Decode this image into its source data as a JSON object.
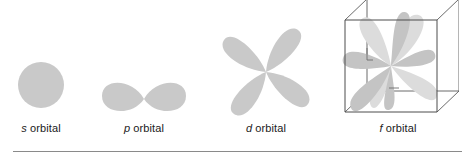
{
  "figure": {
    "background_color": "#ffffff",
    "lobe_fill_color": "#c9c9c9",
    "lobe_fill_color_light": "#dcdcdc",
    "cube_edge_color": "#4d4d4d",
    "caption_color": "#1a1a1a",
    "rule_color": "#8a8a8a"
  },
  "orbitals": [
    {
      "symbol": "s",
      "caption_rest": " orbital",
      "shape": "sphere",
      "lobe_count": 1,
      "has_cube": false
    },
    {
      "symbol": "p",
      "caption_rest": " orbital",
      "shape": "two-lobe-dumbbell",
      "lobe_count": 2,
      "has_cube": false
    },
    {
      "symbol": "d",
      "caption_rest": " orbital",
      "shape": "four-lobe-cloverleaf",
      "lobe_count": 4,
      "has_cube": false
    },
    {
      "symbol": "f",
      "caption_rest": " orbital",
      "shape": "eight-lobe-cubic",
      "lobe_count": 8,
      "has_cube": true
    }
  ]
}
